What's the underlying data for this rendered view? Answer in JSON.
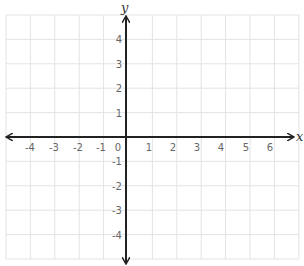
{
  "diagram": {
    "type": "coordinate-plane",
    "x_axis_label": "x",
    "y_axis_label": "y",
    "x_tick_labels": [
      "-4",
      "-3",
      "-2",
      "-1",
      "0",
      "1",
      "2",
      "3",
      "4",
      "5",
      "6"
    ],
    "y_tick_labels": [
      "4",
      "3",
      "2",
      "1",
      "-1",
      "-2",
      "-3",
      "-4"
    ],
    "x_range": [
      -5,
      7
    ],
    "y_range": [
      -5,
      5
    ],
    "grid": true,
    "colors": {
      "grid": "#e3e3e3",
      "axis": "#222222",
      "tick_label": "#666666",
      "axis_label": "#333333"
    }
  }
}
